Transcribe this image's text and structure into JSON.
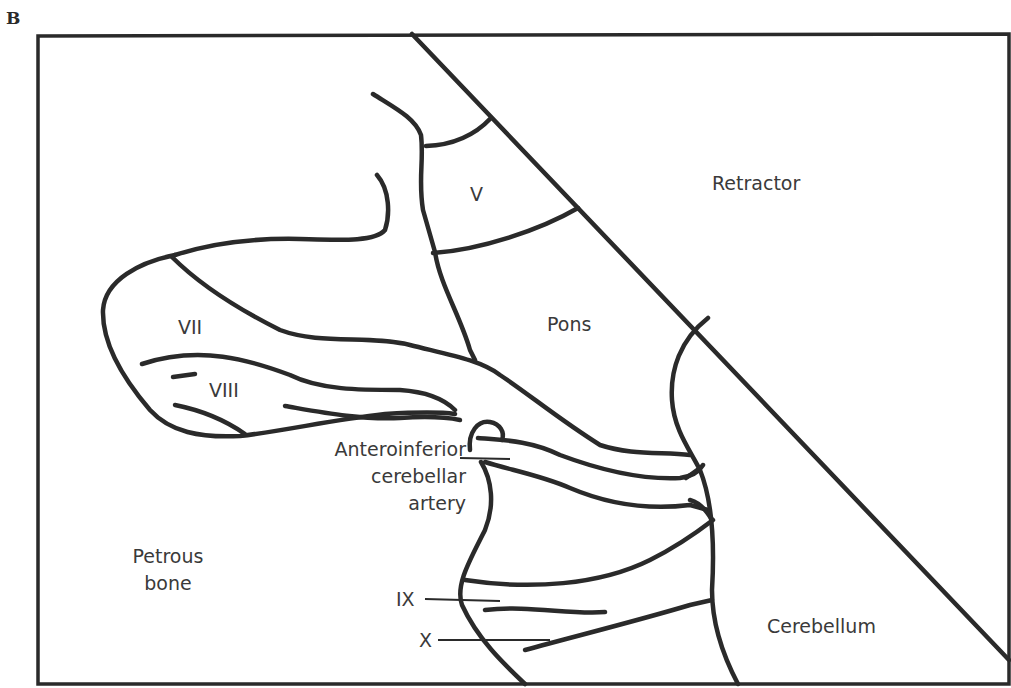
{
  "panel": {
    "letter": "B"
  },
  "labels": {
    "retractor": "Retractor",
    "v": "V",
    "pons": "Pons",
    "vii": "VII",
    "viii": "VIII",
    "aica_line1": "Anteroinferior",
    "aica_line2": "cerebellar",
    "aica_line3": "artery",
    "petrous_line1": "Petrous",
    "petrous_line2": "bone",
    "ix": "IX",
    "x": "X",
    "cerebellum": "Cerebellum"
  },
  "colors": {
    "line": "#2a2a2a",
    "text": "#3a3a3a",
    "background": "#ffffff"
  }
}
